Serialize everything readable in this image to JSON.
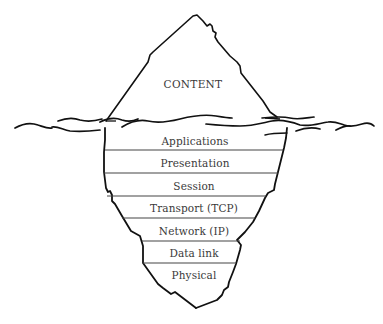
{
  "diagram": {
    "type": "iceberg",
    "above_water": {
      "label": "CONTENT"
    },
    "below_water": {
      "layers": [
        {
          "label": "Applications"
        },
        {
          "label": "Presentation"
        },
        {
          "label": "Session"
        },
        {
          "label": "Transport (TCP)"
        },
        {
          "label": "Network (IP)"
        },
        {
          "label": "Data link"
        },
        {
          "label": "Physical"
        }
      ]
    },
    "colors": {
      "stroke": "#111111",
      "separator": "#444444",
      "text": "#3a3a3a",
      "background": "#ffffff"
    }
  }
}
